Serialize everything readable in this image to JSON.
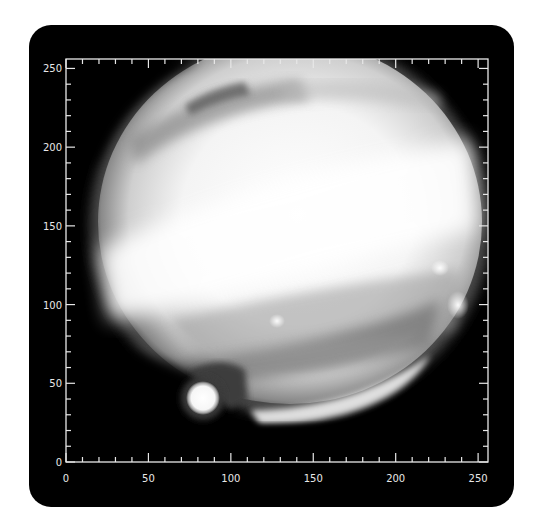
{
  "figure": {
    "background": "#000000",
    "frame_color": "#e8e8e8",
    "page_background": "#ffffff"
  },
  "axes": {
    "x": {
      "min": 0,
      "max": 256,
      "major_ticks": [
        0,
        50,
        100,
        150,
        200,
        250
      ],
      "major_labels": [
        "0",
        "50",
        "100",
        "150",
        "200",
        "250"
      ],
      "minor_step": 10
    },
    "y": {
      "min": 0,
      "max": 256,
      "major_ticks": [
        0,
        50,
        100,
        150,
        200,
        250
      ],
      "major_labels": [
        "0",
        "50",
        "100",
        "150",
        "200",
        "250"
      ],
      "minor_step": 10
    }
  },
  "features": [
    {
      "name": "jupiter-disk",
      "center": [
        142,
        148
      ],
      "note": "planet disk, oblate, clipped at top"
    },
    {
      "name": "bright-equatorial-band",
      "note": "tilted bright band across center"
    },
    {
      "name": "moon",
      "center": [
        88,
        38
      ],
      "note": "bright satellite at lower-left limb"
    },
    {
      "name": "spot-right-upper",
      "center": [
        228,
        124
      ]
    },
    {
      "name": "spot-right-lower",
      "center": [
        238,
        101
      ]
    },
    {
      "name": "spot-center",
      "center": [
        128,
        91
      ]
    }
  ]
}
